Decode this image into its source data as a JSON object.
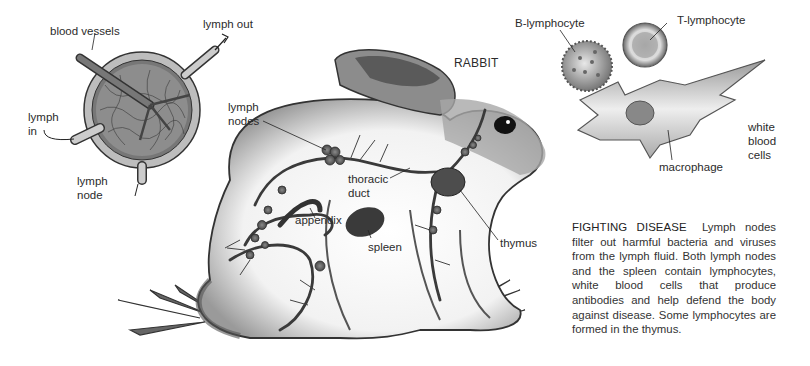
{
  "labels": {
    "blood_vessels": "blood vessels",
    "lymph_out": "lymph out",
    "lymph_in_1": "lymph",
    "lymph_in_2": "in",
    "lymph_node_1": "lymph",
    "lymph_node_2": "node",
    "lymph_nodes_1": "lymph",
    "lymph_nodes_2": "nodes",
    "rabbit": "RABBIT",
    "thoracic_1": "thoracic",
    "thoracic_2": "duct",
    "appendix": "appendix",
    "spleen": "spleen",
    "thymus": "thymus",
    "b_lymphocyte": "B-lymphocyte",
    "t_lymphocyte": "T-lymphocyte",
    "white_1": "white",
    "white_2": "blood",
    "white_3": "cells",
    "macrophage": "macrophage"
  },
  "caption": {
    "heading": "FIGHTING DISEASE",
    "body": "Lymph nodes filter out harmful bacteria and viruses from the lymph fluid. Both lymph nodes and the spleen contain lymphocytes, white blood cells that produce antibodies and help defend the body against disease. Some lymphocytes are formed in the thymus."
  }
}
